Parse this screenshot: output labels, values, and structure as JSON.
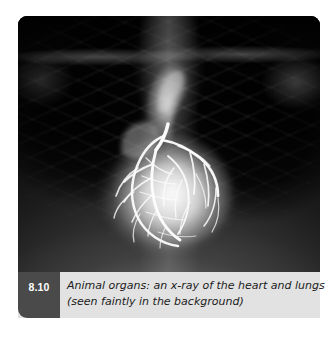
{
  "figure": {
    "number": "8.10",
    "caption_line1": "Animal organs: an x-ray of the heart and lungs",
    "caption_line2": "(seen faintly in the background)",
    "caption_full": "Animal organs: an x-ray of the heart and lungs (seen faintly in the background)",
    "image_kind": "chest-xray-angiogram",
    "image_alt": "Chest x-ray showing a brightly opacified heart with coronary arteries and faint lungs, ribs and clavicles in the background"
  },
  "colors": {
    "page_background": "#ffffff",
    "caption_background": "#e2e2e2",
    "figure_number_background": "#4a4a4a",
    "figure_number_text": "#ffffff",
    "caption_text": "#1b1b1b",
    "xray_dark": "#050505",
    "xray_soft_tissue": "#3a3a3a",
    "heart_bright": "#f5f5f5"
  }
}
